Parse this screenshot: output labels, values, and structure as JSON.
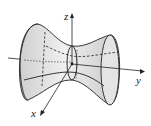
{
  "diagram": {
    "axis_of_symmetry": "y",
    "axes": {
      "x_label": "x",
      "y_label": "y",
      "z_label": "z"
    },
    "colors": {
      "surface_fill": "#d8d8d8",
      "surface_stroke": "#222222",
      "axis": "#222222",
      "background": "#ffffff"
    }
  }
}
